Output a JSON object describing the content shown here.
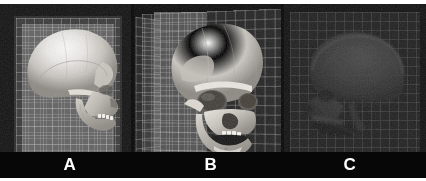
{
  "figure": {
    "kind": "multi-panel-grayscale-figure",
    "panel_count": 3,
    "background_color": "#0a0a0a",
    "label_color": "#ffffff"
  },
  "panels": [
    {
      "label": "A",
      "view": "lateral-skull-left-facing-right",
      "description": "Bright shaded 3D skull rendering in lateral (side) profile facing right, superimposed on a single translucent rectangular reference grid plane.",
      "grid_plane_count": 1,
      "tone": "bright",
      "background_color": "#131313",
      "plane_color": "#969696"
    },
    {
      "label": "B",
      "view": "oblique-three-quarter-skull-facing-left",
      "description": "Bright shaded 3D skull rendering in three-quarter oblique view with open mandible, intersecting translucent grid planes forming a corner behind and beside the skull.",
      "grid_plane_count": 2,
      "tone": "bright",
      "background_color": "#0c0c0c",
      "plane_color": "#b9b9b9"
    },
    {
      "label": "C",
      "view": "lateral-skull-radiograph-facing-left",
      "description": "Low-contrast dark radiograph-style lateral skull projection facing left on a uniformly dark gray field with a faint grid.",
      "grid_plane_count": 1,
      "tone": "dark",
      "background_color": "#111111",
      "plane_color": "#464646"
    }
  ]
}
